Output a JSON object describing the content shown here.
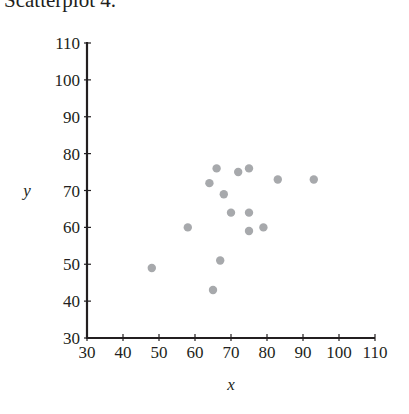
{
  "title": "Scatterplot 4.",
  "chart_data": {
    "type": "scatter",
    "title": "Scatterplot 4.",
    "xlabel": "x",
    "ylabel": "y",
    "xlim": [
      30,
      110
    ],
    "ylim": [
      30,
      110
    ],
    "xticks": [
      30,
      40,
      50,
      60,
      70,
      80,
      90,
      100,
      110
    ],
    "yticks": [
      30,
      40,
      50,
      60,
      70,
      80,
      90,
      100,
      110
    ],
    "grid": false,
    "legend": null,
    "marker_color": "#a7a9ac",
    "points": [
      {
        "x": 48,
        "y": 49
      },
      {
        "x": 58,
        "y": 60
      },
      {
        "x": 64,
        "y": 72
      },
      {
        "x": 66,
        "y": 76
      },
      {
        "x": 68,
        "y": 69
      },
      {
        "x": 65,
        "y": 43
      },
      {
        "x": 67,
        "y": 51
      },
      {
        "x": 70,
        "y": 64
      },
      {
        "x": 72,
        "y": 75
      },
      {
        "x": 75,
        "y": 76
      },
      {
        "x": 75,
        "y": 64
      },
      {
        "x": 75,
        "y": 59
      },
      {
        "x": 79,
        "y": 60
      },
      {
        "x": 83,
        "y": 73
      },
      {
        "x": 93,
        "y": 73
      }
    ]
  }
}
